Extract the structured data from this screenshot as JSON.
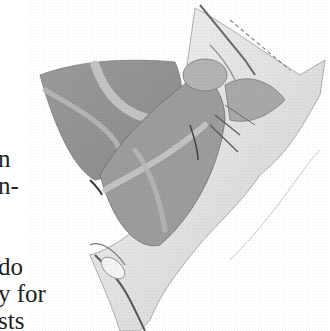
{
  "page": {
    "background": "#ffffff",
    "text_color": "#1e1e1e"
  },
  "text_fragments": [
    {
      "text": "n",
      "top": 146
    },
    {
      "text": "n-",
      "top": 173
    },
    {
      "text": "",
      "top": 200
    },
    {
      "text": "",
      "top": 227
    },
    {
      "text": "do",
      "top": 254
    },
    {
      "text": "y for",
      "top": 281
    },
    {
      "text": "sts",
      "top": 308
    }
  ],
  "illustration": {
    "subject": "moth resting on twig",
    "style": "pencil drawing",
    "caption": ""
  }
}
